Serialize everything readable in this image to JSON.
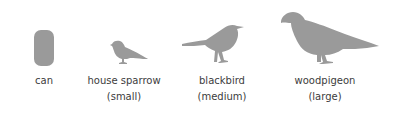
{
  "colors": {
    "silhouette": "#9a9a9a",
    "text": "#3c3c3c",
    "background": "#ffffff"
  },
  "items": [
    {
      "name": "can",
      "label": "can",
      "size": ""
    },
    {
      "name": "house sparrow",
      "label": "house sparrow",
      "size": "(small)"
    },
    {
      "name": "blackbird",
      "label": "blackbird",
      "size": "(medium)"
    },
    {
      "name": "woodpigeon",
      "label": "woodpigeon",
      "size": "(large)"
    }
  ]
}
